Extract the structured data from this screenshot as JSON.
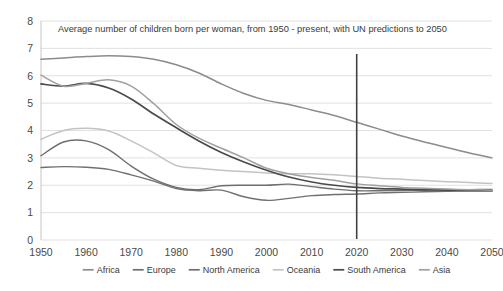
{
  "chart_data": {
    "type": "line",
    "title": "Average number of children born per woman, from 1950 - present, with UN predictions to 2050",
    "xlabel": "",
    "ylabel": "",
    "xlim": [
      1950,
      2050
    ],
    "ylim": [
      0,
      8
    ],
    "grid": true,
    "legend_position": "bottom",
    "x_ticks": [
      "1950",
      "1960",
      "1970",
      "1980",
      "1990",
      "2000",
      "2010",
      "2020",
      "2030",
      "2040",
      "2050"
    ],
    "y_ticks": [
      "0",
      "1",
      "2",
      "3",
      "4",
      "5",
      "6",
      "7",
      "8"
    ],
    "x": [
      1950,
      1955,
      1960,
      1965,
      1970,
      1975,
      1980,
      1985,
      1990,
      1995,
      2000,
      2005,
      2010,
      2015,
      2020,
      2025,
      2030,
      2035,
      2040,
      2045,
      2050
    ],
    "annotations": [
      {
        "type": "vertical-line",
        "x": 2020,
        "label": "present-divider",
        "color": "#404040"
      }
    ],
    "series": [
      {
        "name": "Africa",
        "color": "#8c8c8c",
        "width": 1.5,
        "values": [
          6.6,
          6.65,
          6.7,
          6.73,
          6.7,
          6.6,
          6.4,
          6.1,
          5.7,
          5.35,
          5.1,
          4.95,
          4.75,
          4.55,
          4.3,
          4.05,
          3.8,
          3.58,
          3.38,
          3.18,
          3.0
        ]
      },
      {
        "name": "Europe",
        "color": "#707070",
        "width": 1.4,
        "values": [
          2.65,
          2.68,
          2.66,
          2.58,
          2.38,
          2.15,
          1.88,
          1.8,
          1.82,
          1.58,
          1.45,
          1.52,
          1.62,
          1.66,
          1.68,
          1.72,
          1.74,
          1.76,
          1.78,
          1.79,
          1.8
        ]
      },
      {
        "name": "North America",
        "color": "#6e6e6e",
        "width": 1.4,
        "values": [
          3.08,
          3.58,
          3.62,
          3.3,
          2.7,
          2.22,
          1.92,
          1.84,
          1.98,
          2.0,
          2.0,
          2.04,
          1.95,
          1.86,
          1.8,
          1.8,
          1.81,
          1.82,
          1.83,
          1.84,
          1.85
        ]
      },
      {
        "name": "Oceania",
        "color": "#c3c3c3",
        "width": 1.5,
        "values": [
          3.68,
          4.0,
          4.08,
          3.98,
          3.62,
          3.18,
          2.72,
          2.62,
          2.55,
          2.5,
          2.45,
          2.42,
          2.42,
          2.38,
          2.32,
          2.26,
          2.22,
          2.17,
          2.13,
          2.1,
          2.06
        ]
      },
      {
        "name": "South America",
        "color": "#4a4a4a",
        "width": 1.7,
        "values": [
          5.7,
          5.62,
          5.72,
          5.55,
          5.15,
          4.6,
          4.1,
          3.62,
          3.2,
          2.85,
          2.55,
          2.3,
          2.12,
          2.0,
          1.92,
          1.88,
          1.86,
          1.84,
          1.82,
          1.81,
          1.8
        ]
      },
      {
        "name": "Asia",
        "color": "#a0a0a0",
        "width": 1.5,
        "values": [
          6.02,
          5.62,
          5.72,
          5.85,
          5.62,
          4.98,
          4.22,
          3.72,
          3.35,
          3.0,
          2.62,
          2.42,
          2.28,
          2.18,
          2.05,
          1.98,
          1.92,
          1.89,
          1.86,
          1.84,
          1.82
        ]
      }
    ]
  },
  "legend": {
    "items": [
      {
        "label": "Africa"
      },
      {
        "label": "Europe"
      },
      {
        "label": "North America"
      },
      {
        "label": "Oceania"
      },
      {
        "label": "South America"
      },
      {
        "label": "Asia"
      }
    ]
  }
}
